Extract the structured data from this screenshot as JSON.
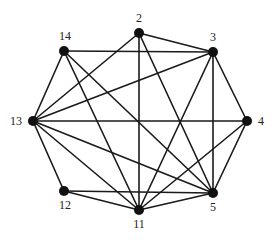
{
  "diagram": {
    "type": "undirected-graph",
    "node_color": "#111111",
    "edge_color": "#1a1a1a",
    "nodes": [
      {
        "id": "2",
        "label": "2",
        "x": 139,
        "y": 33,
        "lx": 139,
        "ly": 22,
        "anchor": "middle"
      },
      {
        "id": "3",
        "label": "3",
        "x": 213,
        "y": 52,
        "lx": 213,
        "ly": 41,
        "anchor": "middle"
      },
      {
        "id": "4",
        "label": "4",
        "x": 247,
        "y": 121,
        "lx": 258,
        "ly": 125,
        "anchor": "start"
      },
      {
        "id": "5",
        "label": "5",
        "x": 213,
        "y": 193,
        "lx": 213,
        "ly": 211,
        "anchor": "middle"
      },
      {
        "id": "11",
        "label": "11",
        "x": 139,
        "y": 210,
        "lx": 139,
        "ly": 228,
        "anchor": "middle"
      },
      {
        "id": "12",
        "label": "12",
        "x": 64,
        "y": 191,
        "lx": 65,
        "ly": 209,
        "anchor": "middle"
      },
      {
        "id": "13",
        "label": "13",
        "x": 33,
        "y": 121,
        "lx": 22,
        "ly": 125,
        "anchor": "end"
      },
      {
        "id": "14",
        "label": "14",
        "x": 64,
        "y": 51,
        "lx": 65,
        "ly": 40,
        "anchor": "middle"
      }
    ],
    "edges": [
      [
        "14",
        "13"
      ],
      [
        "14",
        "3"
      ],
      [
        "14",
        "11"
      ],
      [
        "14",
        "5"
      ],
      [
        "2",
        "13"
      ],
      [
        "2",
        "3"
      ],
      [
        "2",
        "11"
      ],
      [
        "2",
        "5"
      ],
      [
        "3",
        "13"
      ],
      [
        "3",
        "11"
      ],
      [
        "3",
        "5"
      ],
      [
        "3",
        "4"
      ],
      [
        "13",
        "4"
      ],
      [
        "13",
        "5"
      ],
      [
        "13",
        "11"
      ],
      [
        "13",
        "12"
      ],
      [
        "12",
        "5"
      ],
      [
        "12",
        "11"
      ],
      [
        "11",
        "5"
      ],
      [
        "11",
        "4"
      ],
      [
        "5",
        "4"
      ]
    ]
  }
}
